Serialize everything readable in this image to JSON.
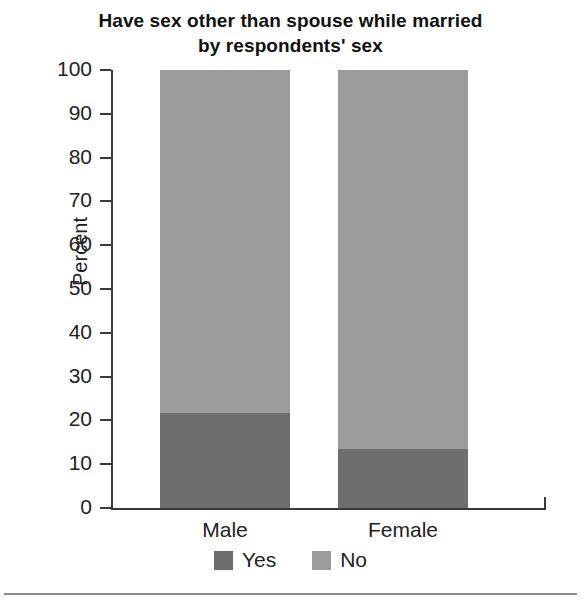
{
  "chart_data": {
    "type": "bar",
    "subtype": "stacked-100-percent",
    "title": "Have sex other than spouse while married by respondents' sex",
    "title_lines": [
      "Have sex other than spouse while married",
      "by respondents' sex"
    ],
    "xlabel": "",
    "ylabel": "Percent",
    "categories": [
      "Male",
      "Female"
    ],
    "ylim": [
      0,
      100
    ],
    "yticks": [
      0,
      10,
      20,
      30,
      40,
      50,
      60,
      70,
      80,
      90,
      100
    ],
    "ytick_labels": [
      "0",
      "10",
      "20",
      "30",
      "40",
      "50",
      "60",
      "70",
      "80",
      "90",
      "100"
    ],
    "grid": false,
    "legend_position": "bottom",
    "series": [
      {
        "name": "Yes",
        "color": "#6e6e6e",
        "values": [
          21.7,
          13.4
        ]
      },
      {
        "name": "No",
        "color": "#9b9b9b",
        "values": [
          78.3,
          86.6
        ]
      }
    ],
    "annotations": []
  },
  "legend": {
    "items": [
      {
        "label": "Yes",
        "color": "#6e6e6e"
      },
      {
        "label": "No",
        "color": "#9b9b9b"
      }
    ]
  },
  "axis": {
    "line_color": "#3a3a3a"
  }
}
